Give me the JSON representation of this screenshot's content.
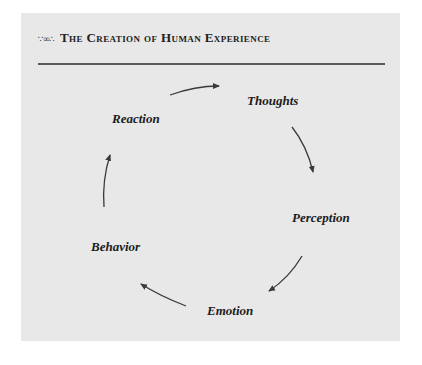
{
  "header": {
    "ornament": "∵∞∴",
    "title": "The Creation of Human Experience"
  },
  "cycle": {
    "nodes": [
      {
        "id": "thoughts",
        "label": "Thoughts"
      },
      {
        "id": "perception",
        "label": "Perception"
      },
      {
        "id": "emotion",
        "label": "Emotion"
      },
      {
        "id": "behavior",
        "label": "Behavior"
      },
      {
        "id": "reaction",
        "label": "Reaction"
      }
    ],
    "direction": "clockwise",
    "edges": [
      {
        "from": "reaction",
        "to": "thoughts"
      },
      {
        "from": "thoughts",
        "to": "perception"
      },
      {
        "from": "perception",
        "to": "emotion"
      },
      {
        "from": "emotion",
        "to": "behavior"
      },
      {
        "from": "behavior",
        "to": "reaction"
      }
    ]
  },
  "colors": {
    "panel": "#e8e8e8",
    "text": "#1c1c1c",
    "arrow": "#3a3a3a",
    "rule": "#5a5a5a"
  }
}
